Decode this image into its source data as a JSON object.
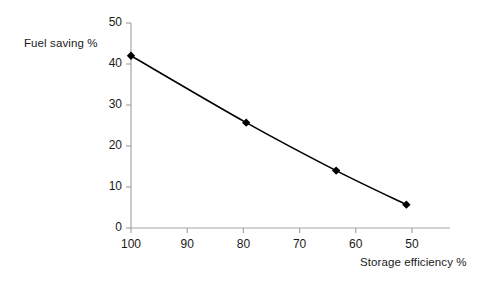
{
  "chart_data": {
    "type": "line",
    "title": "",
    "xlabel": "Storage efficiency %",
    "ylabel": "Fuel saving %",
    "x": [
      100,
      79.5,
      63.5,
      51
    ],
    "values": [
      42,
      25.7,
      14,
      5.7
    ],
    "series": [
      {
        "name": "Fuel saving",
        "values": [
          42,
          25.7,
          14,
          5.7
        ]
      }
    ],
    "xlim": [
      103,
      47
    ],
    "ylim": [
      0,
      50
    ],
    "x_ticks": [
      100,
      90,
      80,
      70,
      60,
      50
    ],
    "y_ticks": [
      0,
      10,
      20,
      30,
      40,
      50
    ],
    "x_tick_labels": [
      "100",
      "90",
      "80",
      "70",
      "60",
      "50"
    ],
    "y_tick_labels": [
      "0",
      "10",
      "20",
      "30",
      "40",
      "50"
    ],
    "x_axis_reversed": true,
    "grid": false,
    "legend": false,
    "marker": "diamond",
    "marker_color": "#000000",
    "line_color": "#000000",
    "axis_color": "#a6a6a6",
    "background_color": "#ffffff"
  }
}
